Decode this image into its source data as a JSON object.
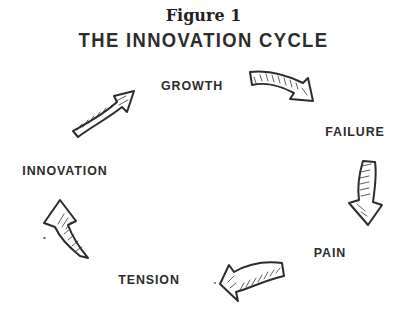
{
  "figure": {
    "caption": "Figure 1",
    "title": "THE INNOVATION CYCLE"
  },
  "cycle": {
    "style": "hand-drawn-sketch",
    "stages": [
      {
        "id": "growth",
        "label": "GROWTH",
        "position": "top"
      },
      {
        "id": "failure",
        "label": "FAILURE",
        "position": "right"
      },
      {
        "id": "pain",
        "label": "PAIN",
        "position": "bottom-right"
      },
      {
        "id": "tension",
        "label": "TENSION",
        "position": "bottom"
      },
      {
        "id": "innovation",
        "label": "INNOVATION",
        "position": "left"
      }
    ],
    "arrows": [
      {
        "from": "GROWTH",
        "to": "FAILURE"
      },
      {
        "from": "FAILURE",
        "to": "PAIN"
      },
      {
        "from": "PAIN",
        "to": "TENSION"
      },
      {
        "from": "TENSION",
        "to": "INNOVATION"
      },
      {
        "from": "INNOVATION",
        "to": "GROWTH"
      }
    ]
  },
  "colors": {
    "ink": "#2c2c2c",
    "background": "#ffffff"
  }
}
